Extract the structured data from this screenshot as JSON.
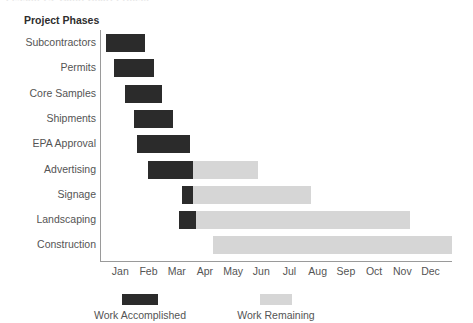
{
  "clipped_title": "Lesson 7.2    Gantt Chart Project",
  "chart_data": {
    "type": "bar",
    "title": "",
    "xlabel": "",
    "ylabel": "Project Phases",
    "axis_heading": "Project Phases",
    "grid": false,
    "legend_position": "bottom",
    "categories": [
      "Subcontractors",
      "Permits",
      "Core Samples",
      "Shipments",
      "EPA Approval",
      "Advertising",
      "Signage",
      "Landscaping",
      "Construction"
    ],
    "x_tick_labels": [
      "Jan",
      "Feb",
      "Mar",
      "Apr",
      "May",
      "Jun",
      "Jul",
      "Aug",
      "Sep",
      "Oct",
      "Nov",
      "Dec"
    ],
    "xlim": [
      0,
      12
    ],
    "series": [
      {
        "name": "Work Accomplished",
        "color": "#2b2b2b"
      },
      {
        "name": "Work Remaining",
        "color": "#d6d6d6"
      }
    ],
    "bars": [
      {
        "category": "Subcontractors",
        "start_month": 0.2,
        "accomplished_end": 1.6,
        "remaining_end": 1.6
      },
      {
        "category": "Permits",
        "start_month": 0.5,
        "accomplished_end": 1.9,
        "remaining_end": 1.9
      },
      {
        "category": "Core Samples",
        "start_month": 0.9,
        "accomplished_end": 2.2,
        "remaining_end": 2.2
      },
      {
        "category": "Shipments",
        "start_month": 1.2,
        "accomplished_end": 2.6,
        "remaining_end": 2.6
      },
      {
        "category": "EPA Approval",
        "start_month": 1.3,
        "accomplished_end": 3.2,
        "remaining_end": 3.2
      },
      {
        "category": "Advertising",
        "start_month": 1.7,
        "accomplished_end": 3.3,
        "remaining_end": 5.6
      },
      {
        "category": "Signage",
        "start_month": 2.9,
        "accomplished_end": 3.3,
        "remaining_end": 7.5
      },
      {
        "category": "Landscaping",
        "start_month": 2.8,
        "accomplished_end": 3.4,
        "remaining_end": 11.0
      },
      {
        "category": "Construction",
        "start_month": 4.0,
        "accomplished_end": 4.0,
        "remaining_end": 12.5
      }
    ],
    "legend": [
      {
        "label": "Work Accomplished",
        "color": "#2b2b2b"
      },
      {
        "label": "Work Remaining",
        "color": "#d6d6d6"
      }
    ]
  }
}
